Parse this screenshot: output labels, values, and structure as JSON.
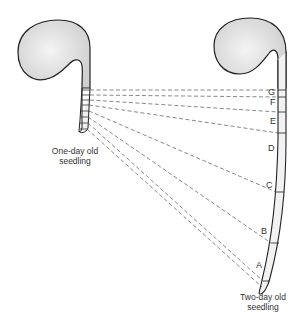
{
  "diagram": {
    "type": "biology-growth-illustration",
    "left_seedling": {
      "caption_line1": "One-day old",
      "caption_line2": "seedling"
    },
    "right_seedling": {
      "caption_line1": "Two-day old",
      "caption_line2": "seedling"
    },
    "segment_labels": [
      "G",
      "F",
      "E",
      "D",
      "C",
      "B",
      "A"
    ],
    "colors": {
      "outline": "#222222",
      "cotyledon_fill": "#e6e6e6",
      "dashed_line": "#555555"
    }
  }
}
